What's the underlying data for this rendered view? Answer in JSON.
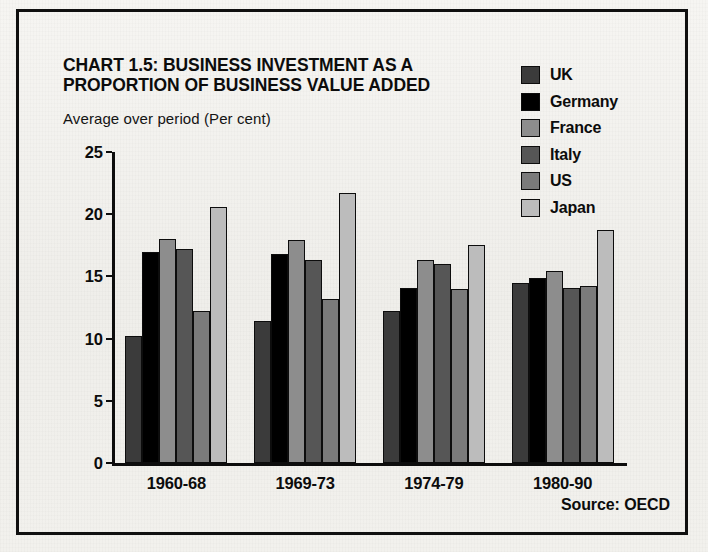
{
  "figure": {
    "title": "CHART 1.5: BUSINESS INVESTMENT AS A PROPORTION OF BUSINESS VALUE ADDED",
    "subtitle": "Average over period (Per cent)",
    "source": "Source: OECD",
    "frame_color": "#101010",
    "background_color": "#f2f1ed"
  },
  "legend": {
    "position": "top-right",
    "entries": [
      {
        "label": "UK",
        "color": "#3b3b3b"
      },
      {
        "label": "Germany",
        "color": "#000000"
      },
      {
        "label": "France",
        "color": "#8d8d8d"
      },
      {
        "label": "Italy",
        "color": "#565656"
      },
      {
        "label": "US",
        "color": "#7b7b7b"
      },
      {
        "label": "Japan",
        "color": "#bcbcbc"
      }
    ]
  },
  "axes": {
    "y_ticks": [
      "0",
      "5",
      "10",
      "15",
      "20",
      "25"
    ],
    "y_min": 0,
    "y_max": 25,
    "x_categories": [
      "1960-68",
      "1969-73",
      "1974-79",
      "1980-90"
    ]
  },
  "chart_data": {
    "type": "bar",
    "title": "CHART 1.5: BUSINESS INVESTMENT AS A PROPORTION OF BUSINESS VALUE ADDED",
    "subtitle": "Average over period (Per cent)",
    "xlabel": "",
    "ylabel": "Average over period (Per cent)",
    "ylim": [
      0,
      25
    ],
    "yticks": [
      0,
      5,
      10,
      15,
      20,
      25
    ],
    "grid": false,
    "legend_position": "top-right",
    "source": "Source: OECD",
    "categories": [
      "1960-68",
      "1969-73",
      "1974-79",
      "1980-90"
    ],
    "series": [
      {
        "name": "UK",
        "color": "#3b3b3b",
        "values": [
          10.2,
          11.4,
          12.2,
          14.5
        ]
      },
      {
        "name": "Germany",
        "color": "#000000",
        "values": [
          17.0,
          16.8,
          14.1,
          14.9
        ]
      },
      {
        "name": "France",
        "color": "#8d8d8d",
        "values": [
          18.0,
          17.9,
          16.3,
          15.4
        ]
      },
      {
        "name": "Italy",
        "color": "#565656",
        "values": [
          17.2,
          16.3,
          16.0,
          14.1
        ]
      },
      {
        "name": "US",
        "color": "#7b7b7b",
        "values": [
          12.2,
          13.2,
          14.0,
          14.2
        ]
      },
      {
        "name": "Japan",
        "color": "#bcbcbc",
        "values": [
          20.6,
          21.7,
          17.5,
          18.7
        ]
      }
    ]
  }
}
